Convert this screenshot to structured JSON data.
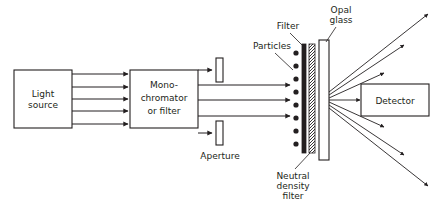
{
  "diagram": {
    "background_color": "#ffffff",
    "line_color": "#231f20",
    "boxes": [
      {
        "id": "light-source",
        "label_line1": "Light",
        "label_line2": "source"
      },
      {
        "id": "monochromator",
        "label_line1": "Mono-",
        "label_line2": "chromator",
        "label_line3": "or filter"
      },
      {
        "id": "detector",
        "label_line1": "Detector"
      }
    ],
    "callouts": [
      {
        "id": "aperture",
        "label": "Aperture"
      },
      {
        "id": "particles",
        "label": "Particles"
      },
      {
        "id": "filter",
        "label": "Filter"
      },
      {
        "id": "opal-glass",
        "label_line1": "Opal",
        "label_line2": "glass"
      },
      {
        "id": "neutral-density-filter",
        "label_line1": "Neutral",
        "label_line2": "density",
        "label_line3": "filter"
      }
    ],
    "counts": {
      "source_beams": 5,
      "beams_through_aperture": 3,
      "particles": 8,
      "scattered_rays_up": 3,
      "scattered_rays_down": 3,
      "direct_rays_to_detector": 1
    }
  }
}
